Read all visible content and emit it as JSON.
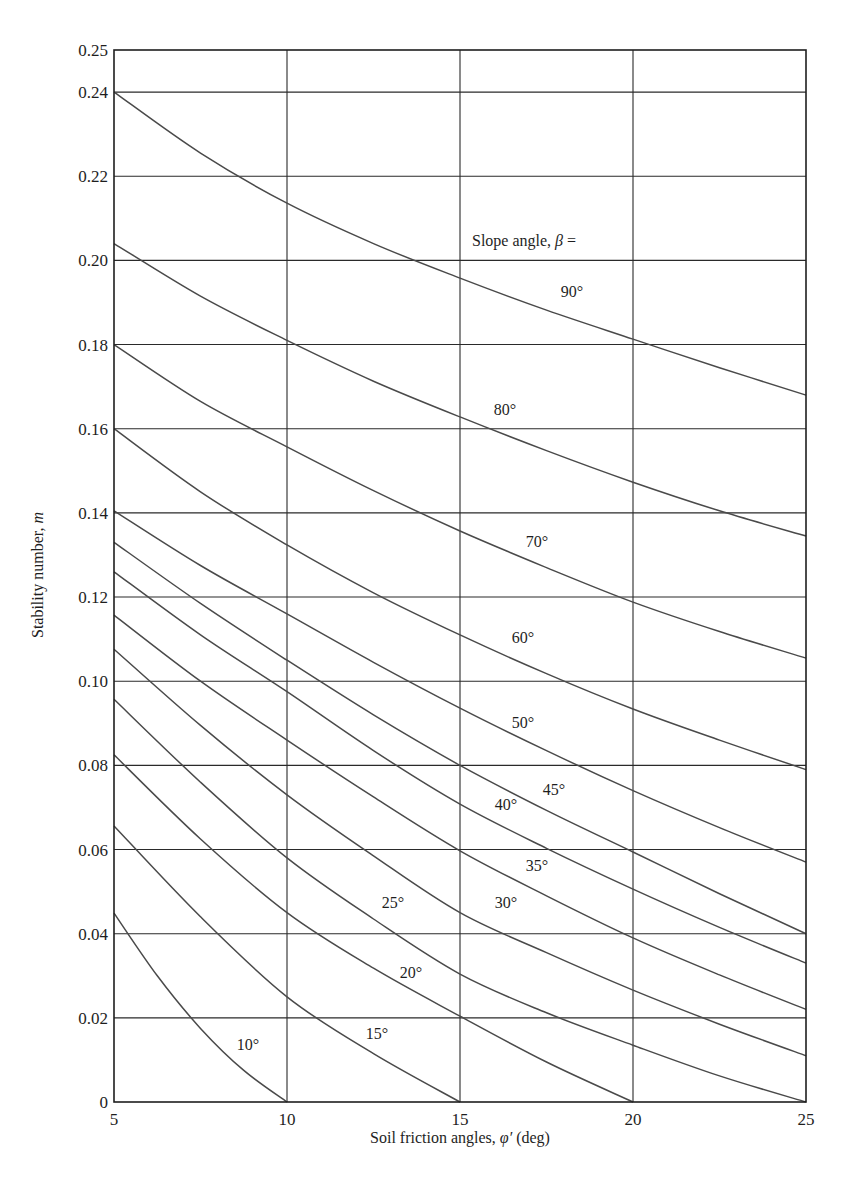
{
  "chart_data": {
    "type": "line",
    "title": "",
    "xlabel": "Soil friction angles, φ′ (deg)",
    "xlabel_parts": {
      "prefix": "Soil friction angles, ",
      "symbol": "φ′",
      "suffix": " (deg)"
    },
    "ylabel": "Stability number, m",
    "ylabel_parts": {
      "prefix": "Stability number, ",
      "symbol": "m"
    },
    "legend_title": "Slope angle, β =",
    "legend_title_parts": {
      "prefix": "Slope angle, ",
      "symbol": "β",
      "suffix": " ="
    },
    "xlim": [
      5,
      25
    ],
    "ylim": [
      0,
      0.25
    ],
    "grid": true,
    "x_ticks": [
      5,
      10,
      15,
      20,
      25
    ],
    "x_tick_labels": [
      "5",
      "10",
      "15",
      "20",
      "25"
    ],
    "y_ticks": [
      0,
      0.02,
      0.04,
      0.06,
      0.08,
      0.1,
      0.12,
      0.14,
      0.16,
      0.18,
      0.2,
      0.22,
      0.24,
      0.25
    ],
    "y_tick_labels": [
      "0",
      "0.02",
      "0.04",
      "0.06",
      "0.08",
      "0.10",
      "0.12",
      "0.14",
      "0.16",
      "0.18",
      "0.20",
      "0.22",
      "0.24",
      "0.25"
    ],
    "x": [
      5,
      10,
      15,
      20,
      25
    ],
    "series": [
      {
        "name": "90°",
        "beta": 90,
        "points": [
          [
            5,
            0.24
          ],
          [
            7.5,
            0.2255
          ],
          [
            10,
            0.2136
          ],
          [
            12.5,
            0.204
          ],
          [
            15,
            0.1958
          ],
          [
            17.5,
            0.1882
          ],
          [
            20,
            0.1813
          ],
          [
            22.5,
            0.1745
          ],
          [
            25,
            0.168
          ]
        ],
        "label_pos": [
          572,
          297
        ]
      },
      {
        "name": "80°",
        "beta": 80,
        "points": [
          [
            5,
            0.204
          ],
          [
            7.5,
            0.1915
          ],
          [
            10,
            0.181
          ],
          [
            12.5,
            0.1713
          ],
          [
            15,
            0.1628
          ],
          [
            17.5,
            0.1548
          ],
          [
            20,
            0.1473
          ],
          [
            22.5,
            0.1405
          ],
          [
            25,
            0.1345
          ]
        ],
        "label_pos": [
          505,
          415
        ]
      },
      {
        "name": "70°",
        "beta": 70,
        "points": [
          [
            5,
            0.18
          ],
          [
            7.5,
            0.1665
          ],
          [
            10,
            0.1557
          ],
          [
            12.5,
            0.1453
          ],
          [
            15,
            0.1357
          ],
          [
            17.5,
            0.127
          ],
          [
            20,
            0.1188
          ],
          [
            22.5,
            0.1118
          ],
          [
            25,
            0.1055
          ]
        ],
        "label_pos": [
          537,
          547
        ]
      },
      {
        "name": "60°",
        "beta": 60,
        "points": [
          [
            5,
            0.16
          ],
          [
            7.5,
            0.145
          ],
          [
            10,
            0.1324
          ],
          [
            12.5,
            0.121
          ],
          [
            15,
            0.111
          ],
          [
            17.5,
            0.1018
          ],
          [
            20,
            0.0934
          ],
          [
            22.5,
            0.086
          ],
          [
            25,
            0.079
          ]
        ],
        "label_pos": [
          523,
          643
        ]
      },
      {
        "name": "50°",
        "beta": 50,
        "points": [
          [
            5,
            0.1405
          ],
          [
            7.5,
            0.1275
          ],
          [
            10,
            0.116
          ],
          [
            12.5,
            0.1045
          ],
          [
            15,
            0.0936
          ],
          [
            17.5,
            0.0835
          ],
          [
            20,
            0.074
          ],
          [
            22.5,
            0.0652
          ],
          [
            25,
            0.057
          ]
        ],
        "label_pos": [
          523,
          728
        ]
      },
      {
        "name": "45°",
        "beta": 45,
        "points": [
          [
            5,
            0.133
          ],
          [
            7.5,
            0.1185
          ],
          [
            10,
            0.105
          ],
          [
            12.5,
            0.092
          ],
          [
            15,
            0.08
          ],
          [
            17.5,
            0.0693
          ],
          [
            20,
            0.0594
          ],
          [
            22.5,
            0.0495
          ],
          [
            25,
            0.04
          ]
        ],
        "label_pos": [
          554,
          795
        ]
      },
      {
        "name": "40°",
        "beta": 40,
        "points": [
          [
            5,
            0.126
          ],
          [
            7.5,
            0.111
          ],
          [
            10,
            0.0975
          ],
          [
            12.5,
            0.0835
          ],
          [
            15,
            0.0708
          ],
          [
            17.5,
            0.0603
          ],
          [
            20,
            0.0506
          ],
          [
            22.5,
            0.0415
          ],
          [
            25,
            0.033
          ]
        ],
        "label_pos": [
          506,
          810
        ]
      },
      {
        "name": "35°",
        "beta": 35,
        "points": [
          [
            5,
            0.1157
          ],
          [
            7.5,
            0.1
          ],
          [
            10,
            0.086
          ],
          [
            12.5,
            0.0725
          ],
          [
            15,
            0.0597
          ],
          [
            17.5,
            0.049
          ],
          [
            20,
            0.039
          ],
          [
            22.5,
            0.0302
          ],
          [
            25,
            0.022
          ]
        ],
        "label_pos": [
          537,
          871
        ]
      },
      {
        "name": "30°",
        "beta": 30,
        "points": [
          [
            5,
            0.1076
          ],
          [
            7.5,
            0.0895
          ],
          [
            10,
            0.073
          ],
          [
            12.5,
            0.0585
          ],
          [
            15,
            0.045
          ],
          [
            17.5,
            0.0355
          ],
          [
            20,
            0.0266
          ],
          [
            22.5,
            0.0185
          ],
          [
            25,
            0.011
          ]
        ],
        "label_pos": [
          506,
          908
        ]
      },
      {
        "name": "25°",
        "beta": 25,
        "points": [
          [
            5,
            0.0957
          ],
          [
            7.5,
            0.076
          ],
          [
            10,
            0.058
          ],
          [
            12.5,
            0.0435
          ],
          [
            15,
            0.0304
          ],
          [
            17.5,
            0.0212
          ],
          [
            20,
            0.0135
          ],
          [
            22.5,
            0.0062
          ],
          [
            25,
            0.0
          ]
        ],
        "label_pos": [
          393,
          908
        ]
      },
      {
        "name": "20°",
        "beta": 20,
        "points": [
          [
            5,
            0.0825
          ],
          [
            7.5,
            0.0625
          ],
          [
            10,
            0.045
          ],
          [
            12.5,
            0.0318
          ],
          [
            15,
            0.0204
          ],
          [
            17.5,
            0.0095
          ],
          [
            20,
            0.0
          ]
        ],
        "label_pos": [
          411,
          978
        ]
      },
      {
        "name": "15°",
        "beta": 15,
        "points": [
          [
            5,
            0.0656
          ],
          [
            7.5,
            0.044
          ],
          [
            10,
            0.025
          ],
          [
            12.5,
            0.0115
          ],
          [
            15,
            0.0
          ]
        ],
        "label_pos": [
          377,
          1039
        ]
      },
      {
        "name": "10°",
        "beta": 10,
        "points": [
          [
            5,
            0.0449
          ],
          [
            6.25,
            0.03
          ],
          [
            7.5,
            0.0175
          ],
          [
            8.75,
            0.0075
          ],
          [
            10,
            0.0
          ]
        ],
        "label_pos": [
          248,
          1050
        ]
      }
    ]
  },
  "colors": {
    "background": "#ffffff",
    "curve": "#4a4a4a",
    "grid": "#2a2a2a",
    "text": "#1e1e1e"
  }
}
